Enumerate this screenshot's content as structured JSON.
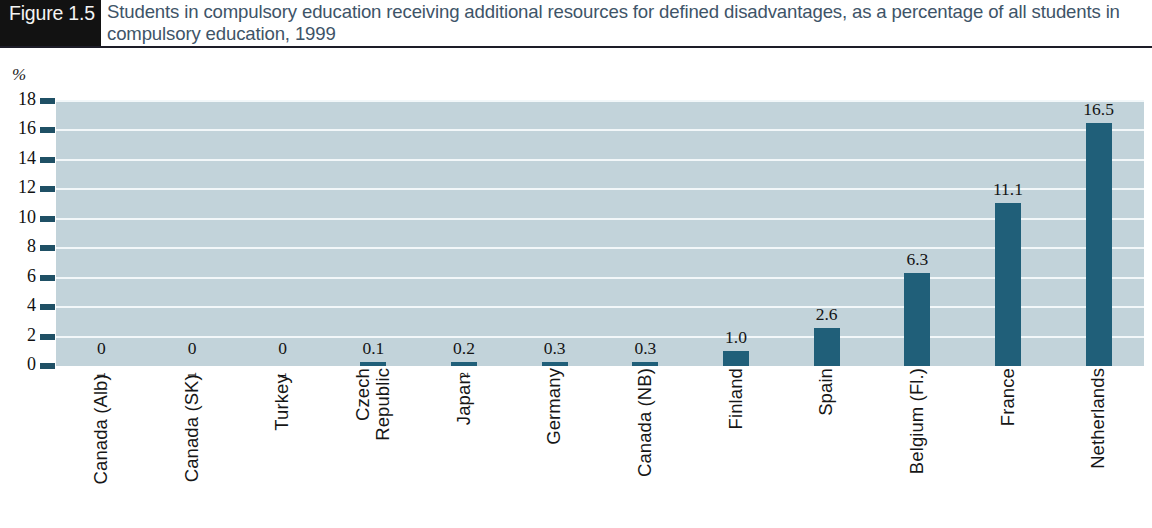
{
  "header": {
    "figure_badge": "Figure 1.5",
    "title": "Students in compulsory education receiving additional resources for defined disadvantages, as a percentage of all students in compulsory education, 1999"
  },
  "colors": {
    "bar": "#205f79",
    "plot_background": "#c2d3da",
    "gridline": "#f2f7f9",
    "tick": "#1f5065",
    "badge_background": "#121212",
    "title_text": "#3e5468"
  },
  "chart_data": {
    "type": "bar",
    "title": "Students in compulsory education receiving additional resources for defined disadvantages, as a percentage of all students in compulsory education, 1999",
    "xlabel": "",
    "ylabel": "%",
    "ylim": [
      0,
      18
    ],
    "yticks": [
      0,
      2,
      4,
      6,
      8,
      10,
      12,
      14,
      16,
      18
    ],
    "ytick_labels": [
      "0",
      "2",
      "4",
      "6",
      "8",
      "10",
      "12",
      "14",
      "16",
      "18"
    ],
    "grid": true,
    "legend": "none",
    "categories": [
      "Canada (Alb)",
      "Canada (SK)",
      "Turkey",
      "Czech Republic",
      "Japan",
      "Germany",
      "Canada (NB)",
      "Finland",
      "Spain",
      "Belgium (Fl.)",
      "France",
      "Netherlands"
    ],
    "category_footnotes": [
      "1",
      "1",
      "1",
      "",
      "2",
      "",
      "",
      "",
      "",
      "",
      "",
      ""
    ],
    "category_lines": [
      [
        "Canada (Alb)"
      ],
      [
        "Canada (SK)"
      ],
      [
        "Turkey"
      ],
      [
        "Czech",
        "Republic"
      ],
      [
        "Japan"
      ],
      [
        "Germany"
      ],
      [
        "Canada (NB)"
      ],
      [
        "Finland"
      ],
      [
        "Spain"
      ],
      [
        "Belgium (Fl.)"
      ],
      [
        "France"
      ],
      [
        "Netherlands"
      ]
    ],
    "values": [
      0,
      0,
      0,
      0.1,
      0.2,
      0.3,
      0.3,
      1.0,
      2.6,
      6.3,
      11.1,
      16.5
    ],
    "value_labels": [
      "0",
      "0",
      "0",
      "0.1",
      "0.2",
      "0.3",
      "0.3",
      "1.0",
      "2.6",
      "6.3",
      "11.1",
      "16.5"
    ],
    "unit": "%"
  },
  "axis": {
    "unit_symbol": "%"
  }
}
